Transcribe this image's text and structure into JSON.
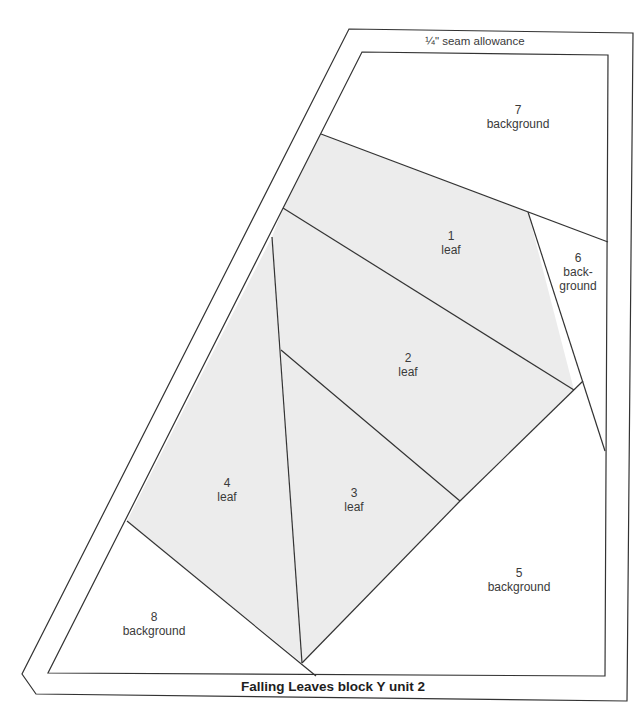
{
  "diagram": {
    "title": "Falling Leaves block Y unit 2",
    "seam_label": "¼\" seam allowance",
    "colors": {
      "leaf_fill": "#ececec",
      "background_fill": "#ffffff",
      "line": "#333333"
    },
    "pieces": [
      {
        "number": "1",
        "fabric": "leaf"
      },
      {
        "number": "2",
        "fabric": "leaf"
      },
      {
        "number": "3",
        "fabric": "leaf"
      },
      {
        "number": "4",
        "fabric": "leaf"
      },
      {
        "number": "5",
        "fabric": "background"
      },
      {
        "number": "6",
        "fabric_line1": "back-",
        "fabric_line2": "ground"
      },
      {
        "number": "7",
        "fabric": "background"
      },
      {
        "number": "8",
        "fabric": "background"
      }
    ]
  }
}
